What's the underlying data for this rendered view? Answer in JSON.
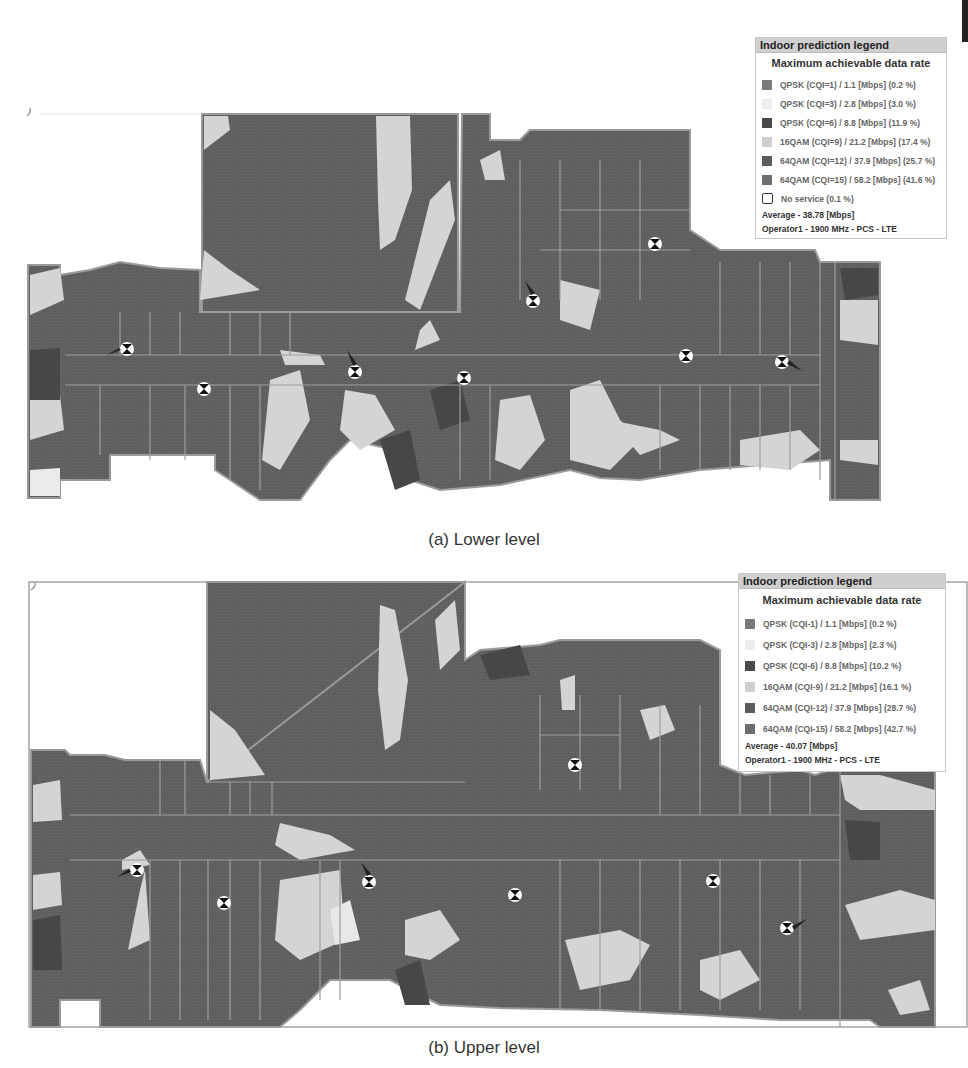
{
  "colors": {
    "cqi1": "#7a7a7a",
    "cqi3": "#ececec",
    "cqi6": "#4a4a4a",
    "cqi9": "#cfcfcf",
    "cqi12": "#5c5c5c",
    "cqi15": "#6e6e6e",
    "wall": "#9a9a9a",
    "light_zone": "#d6d6d6"
  },
  "figures": [
    {
      "id": "lower",
      "caption": "(a) Lower level",
      "legend": {
        "title": "Indoor prediction legend",
        "subtitle": "Maximum achievable data rate",
        "items": [
          {
            "label": "QPSK (CQI=1) / 1.1 [Mbps] (0.2 %)",
            "swatch": "cqi1"
          },
          {
            "label": "QPSK (CQI=3) / 2.8 [Mbps] (3.0 %)",
            "swatch": "cqi3"
          },
          {
            "label": "QPSK (CQI=6) / 8.8 [Mbps] (11.9 %)",
            "swatch": "cqi6"
          },
          {
            "label": "16QAM (CQI=9) / 21.2 [Mbps] (17.4 %)",
            "swatch": "cqi9"
          },
          {
            "label": "64QAM (CQI=12) / 37.9 [Mbps] (25.7 %)",
            "swatch": "cqi12"
          },
          {
            "label": "64QAM (CQI=15) / 58.2 [Mbps] (41.6 %)",
            "swatch": "cqi15"
          },
          {
            "label": "No service (0.1 %)",
            "swatch": "none"
          }
        ],
        "average": "Average - 38.78 [Mbps]",
        "operator": "Operator1 - 1900 MHz - PCS - LTE"
      },
      "access_points": 8
    },
    {
      "id": "upper",
      "caption": "(b) Upper level",
      "legend": {
        "title": "Indoor prediction legend",
        "subtitle": "Maximum achievable data rate",
        "items": [
          {
            "label": "QPSK (CQI-1) / 1.1 [Mbps] (0.2 %)",
            "swatch": "cqi1"
          },
          {
            "label": "QPSK (CQI-3) / 2.8 [Mbps] (2.3 %)",
            "swatch": "cqi3"
          },
          {
            "label": "QPSK (CQI-6) / 8.8 [Mbps] (10.2 %)",
            "swatch": "cqi6"
          },
          {
            "label": "16QAM (CQI-9) / 21.2 [Mbps] (16.1 %)",
            "swatch": "cqi9"
          },
          {
            "label": "64QAM (CQI-12) / 37.9 [Mbps] (28.7 %)",
            "swatch": "cqi12"
          },
          {
            "label": "64QAM (CQI-15) / 58.2 [Mbps] (42.7 %)",
            "swatch": "cqi15"
          }
        ],
        "average": "Average - 40.07 [Mbps]",
        "operator": "Operator1 - 1900 MHz - PCS - LTE"
      },
      "access_points": 7
    }
  ]
}
